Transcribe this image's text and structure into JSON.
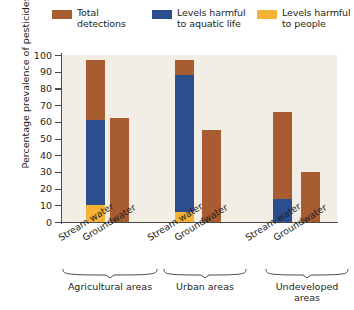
{
  "chart_data": {
    "type": "bar",
    "title": "",
    "subtitle": "",
    "xlabel": "",
    "ylabel": "Percentage prevalence of pesticides",
    "ylim": [
      0,
      100
    ],
    "yticks": [
      0,
      10,
      20,
      30,
      40,
      50,
      60,
      70,
      80,
      90,
      100
    ],
    "grid": false,
    "legend_position": "top",
    "stacked_overlay": true,
    "categories": [
      "Agricultural areas — Stream water",
      "Agricultural areas — Groundwater",
      "Urban areas — Stream water",
      "Urban areas — Groundwater",
      "Undeveloped areas — Stream water",
      "Undeveloped areas — Groundwater"
    ],
    "series": [
      {
        "name": "Total detections",
        "color": "#a85c32",
        "values": [
          97,
          62,
          97,
          55,
          66,
          30
        ]
      },
      {
        "name": "Levels harmful to aquatic life",
        "color": "#2b4f8e",
        "values": [
          61,
          0,
          88,
          0,
          14,
          0
        ]
      },
      {
        "name": "Levels harmful to people",
        "color": "#f5b335",
        "values": [
          10,
          0,
          6,
          0,
          0,
          0
        ]
      }
    ],
    "groups": [
      {
        "label": "Agricultural areas",
        "bars": [
          "Stream water",
          "Groundwater"
        ]
      },
      {
        "label": "Urban areas",
        "bars": [
          "Stream water",
          "Groundwater"
        ]
      },
      {
        "label": "Undeveloped\nareas",
        "bars": [
          "Stream water",
          "Groundwater"
        ]
      }
    ],
    "plot_background": "#f2ede5",
    "axis_color": "#4a4a4a"
  },
  "legend": {
    "items": [
      {
        "label": "Total\ndetections",
        "color": "#a85c32"
      },
      {
        "label": "Levels harmful\nto aquatic life",
        "color": "#2b4f8e"
      },
      {
        "label": "Levels harmful\nto people",
        "color": "#f5b335"
      }
    ]
  },
  "axis": {
    "y_title": "Percentage prevalence of pesticides",
    "y_ticks": [
      "100",
      "90",
      "80",
      "70",
      "60",
      "50",
      "40",
      "30",
      "20",
      "10",
      "0"
    ]
  },
  "x_labels": [
    "Stream water",
    "Groundwater",
    "Stream water",
    "Groundwater",
    "Stream water",
    "Groundwater"
  ],
  "group_labels": [
    "Agricultural areas",
    "Urban areas",
    "Undeveloped\nareas"
  ]
}
